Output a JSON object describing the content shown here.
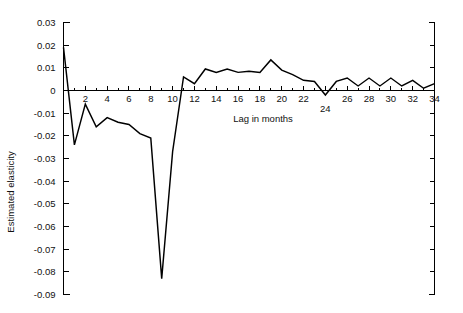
{
  "chart_data": {
    "type": "line",
    "title": "",
    "xlabel": "Lag in months",
    "ylabel": "Estimated elasticity",
    "xlim": [
      0,
      34
    ],
    "ylim": [
      -0.09,
      0.03
    ],
    "grid": false,
    "legend": "none",
    "ytick_labels": [
      "0.03",
      "0.02",
      "0.01",
      "0",
      "-0.01",
      "-0.02",
      "-0.03",
      "-0.04",
      "-0.05",
      "-0.06",
      "-0.07",
      "-0.08",
      "-0.09"
    ],
    "ytick_values": [
      0.03,
      0.02,
      0.01,
      0,
      -0.01,
      -0.02,
      -0.03,
      -0.04,
      -0.05,
      -0.06,
      -0.07,
      -0.08,
      -0.09
    ],
    "xtick_labels": [
      "2",
      "4",
      "6",
      "8",
      "10",
      "12",
      "14",
      "16",
      "18",
      "20",
      "22",
      "24",
      "26",
      "28",
      "30",
      "32",
      "34"
    ],
    "xtick_values": [
      2,
      4,
      6,
      8,
      10,
      12,
      14,
      16,
      18,
      20,
      22,
      24,
      26,
      28,
      30,
      32,
      34
    ],
    "xtick_minor_values": [
      1,
      3,
      5,
      7,
      9,
      11,
      13,
      15,
      17,
      19,
      21,
      23,
      25,
      27,
      29,
      31,
      33
    ],
    "below_axis_labels": [
      "24"
    ],
    "x": [
      0,
      1,
      2,
      3,
      4,
      5,
      6,
      7,
      8,
      9,
      10,
      11,
      12,
      13,
      14,
      15,
      16,
      17,
      18,
      19,
      20,
      21,
      22,
      23,
      24,
      25,
      26,
      27,
      28,
      29,
      30,
      31,
      32,
      33,
      34
    ],
    "values": [
      0.019,
      -0.024,
      -0.006,
      -0.016,
      -0.012,
      -0.014,
      -0.015,
      -0.019,
      -0.021,
      -0.083,
      -0.027,
      0.006,
      0.003,
      0.0095,
      0.008,
      0.0095,
      0.008,
      0.0085,
      0.008,
      0.0135,
      0.009,
      0.007,
      0.0045,
      0.004,
      -0.002,
      0.004,
      0.0055,
      0.002,
      0.0055,
      0.002,
      0.0055,
      0.002,
      0.0045,
      0.001,
      0.003
    ],
    "series_name": "Estimated elasticity",
    "line_color": "#000000",
    "background_color": "#ffffff"
  },
  "axes": {
    "left_axis_name": "left-y-axis",
    "right_axis_name": "right-y-axis",
    "x_axis_name": "x-axis-zero-line"
  }
}
